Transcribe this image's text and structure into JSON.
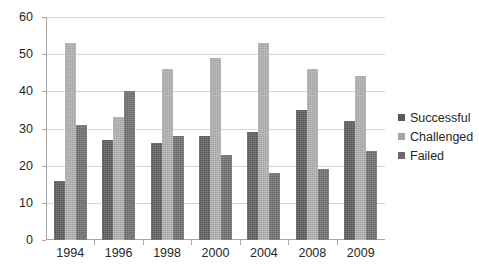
{
  "chart_data": {
    "type": "bar",
    "title": "",
    "subtitle": "",
    "xlabel": "",
    "ylabel": "",
    "categories": [
      "1994",
      "1996",
      "1998",
      "2000",
      "2004",
      "2008",
      "2009"
    ],
    "series": [
      {
        "name": "Successful",
        "color": "#595959",
        "values": [
          16,
          27,
          26,
          28,
          29,
          35,
          32
        ]
      },
      {
        "name": "Challenged",
        "color": "#a5a5a5",
        "values": [
          53,
          33,
          46,
          49,
          53,
          46,
          44
        ]
      },
      {
        "name": "Failed",
        "color": "#6b6b6b",
        "values": [
          31,
          40,
          28,
          23,
          18,
          19,
          24
        ]
      }
    ],
    "ylim": [
      0,
      60
    ],
    "yticks": [
      0,
      10,
      20,
      30,
      40,
      50,
      60
    ],
    "ytick_labels": [
      "0",
      "10",
      "20",
      "30",
      "40",
      "50",
      "60"
    ],
    "grid": true,
    "grid_axis": "y",
    "legend_position": "right"
  },
  "legend": {
    "items": [
      {
        "label": "Successful",
        "color": "#595959"
      },
      {
        "label": "Challenged",
        "color": "#a5a5a5"
      },
      {
        "label": "Failed",
        "color": "#6b6b6b"
      }
    ]
  }
}
